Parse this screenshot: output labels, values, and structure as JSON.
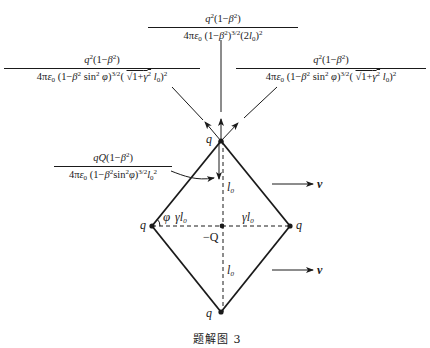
{
  "figure": {
    "caption": "题解图 3"
  },
  "force_labels": {
    "top": {
      "numerator": "q²(1−β²)",
      "denominator": "4πε₀ (1−β²)^{3/2} (2l₀)²"
    },
    "upper_left": {
      "numerator": "q²(1−β²)",
      "denominator": "4πε₀ (1−β² sin²φ)^{3/2} (√(1+γ²) l₀)²"
    },
    "upper_right": {
      "numerator": "q²(1−β²)",
      "denominator": "4πε₀ (1−β² sin²φ)^{3/2} (√(1+γ²) l₀)²"
    },
    "central_attraction": {
      "numerator": "qQ(1−β²)",
      "denominator": "4πε₀ (1−β²sin²φ)^{3/2} l₀²"
    }
  },
  "charges": {
    "top": "q",
    "left": "q",
    "right": "q",
    "bottom": "q",
    "center": "−Q"
  },
  "dimensions": {
    "half_vertical_upper": "l₀",
    "half_vertical_lower": "l₀",
    "half_horizontal_left": "γl₀",
    "half_horizontal_right": "γl₀",
    "angle": "φ"
  },
  "velocity_label": "v",
  "geometry": {
    "top": [
      221,
      141
    ],
    "left": [
      152,
      226
    ],
    "right": [
      290,
      226
    ],
    "bottom": [
      221,
      312
    ],
    "center": [
      221,
      226
    ]
  }
}
